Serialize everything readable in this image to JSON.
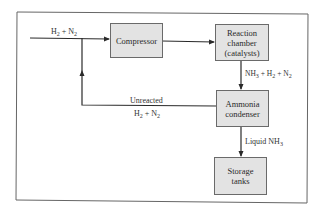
{
  "diagram": {
    "type": "process-flow",
    "colors": {
      "box_fill": "#e3e3e3",
      "line": "#2a2a2a",
      "frame": "#555555"
    },
    "nodes": [
      {
        "id": "compressor",
        "label": "Compressor"
      },
      {
        "id": "reaction",
        "label_lines": [
          "Reaction",
          "chamber",
          "(catalysts)"
        ]
      },
      {
        "id": "condenser",
        "label_lines": [
          "Ammonia",
          "condenser"
        ]
      },
      {
        "id": "storage",
        "label_lines": [
          "Storage",
          "tanks"
        ]
      }
    ],
    "edges": [
      {
        "from": "input",
        "to": "compressor",
        "label": {
          "a": "H",
          "a_sub": "2",
          "plus": " + N",
          "b_sub": "2"
        }
      },
      {
        "from": "compressor",
        "to": "reaction",
        "label": null
      },
      {
        "from": "reaction",
        "to": "condenser",
        "label": {
          "p1": "NH",
          "p1_sub": "3",
          "p2": " + H",
          "p2_sub": "2",
          "p3": " + N",
          "p3_sub": "2"
        }
      },
      {
        "from": "condenser",
        "to": "input-junction",
        "label": {
          "line1": "Unreacted",
          "a": "H",
          "a_sub": "2",
          "plus": " + N",
          "b_sub": "2"
        }
      },
      {
        "from": "condenser",
        "to": "storage",
        "label": {
          "text": "Liquid NH",
          "sub": "3"
        }
      }
    ]
  }
}
